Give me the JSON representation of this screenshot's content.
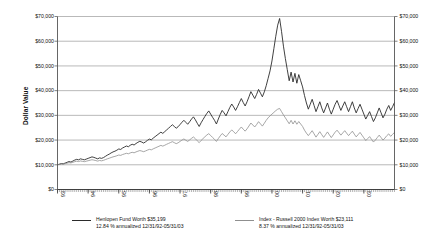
{
  "chart_data": {
    "type": "line",
    "title": "",
    "xlabel": "",
    "ylabel": "Dollar Value",
    "ylim": [
      0,
      70000
    ],
    "y_ticks": [
      "$0",
      "$10,000",
      "$20,000",
      "$30,000",
      "$40,000",
      "$50,000",
      "$60,000",
      "$70,000"
    ],
    "y_tick_values": [
      0,
      10000,
      20000,
      30000,
      40000,
      50000,
      60000,
      70000
    ],
    "right_axis_ticks": [
      "$0",
      "$10,000",
      "$20,000",
      "$30,000",
      "$40,000",
      "$50,000",
      "$60,000",
      "$70,000"
    ],
    "grid": true,
    "legend_position": "bottom",
    "x_tick_labels": [
      "93",
      "94",
      "95",
      "96",
      "97",
      "98",
      "99",
      "00",
      "01",
      "02",
      "03"
    ],
    "x_range_start": "12/31/92",
    "x_range_end": "05/31/03",
    "series": [
      {
        "name": "Henlopen Fund",
        "color": "#2b2b2b",
        "final_value": 35199,
        "values": [
          10000,
          10250,
          10500,
          10400,
          10700,
          11000,
          11300,
          11100,
          11500,
          11900,
          12200,
          12000,
          12400,
          12200,
          12000,
          12300,
          12600,
          12900,
          13200,
          13000,
          12700,
          12400,
          12800,
          12600,
          12900,
          13400,
          13900,
          14300,
          14800,
          15200,
          15500,
          15900,
          16400,
          16200,
          16800,
          17200,
          17600,
          17300,
          17900,
          18300,
          18000,
          18600,
          19100,
          19500,
          19200,
          18800,
          19300,
          19900,
          20400,
          20100,
          20800,
          21400,
          22000,
          22600,
          23200,
          22700,
          23400,
          24100,
          24800,
          25500,
          26200,
          25500,
          24800,
          25400,
          26300,
          27200,
          28000,
          27200,
          26400,
          27400,
          28500,
          29400,
          28200,
          26800,
          25500,
          27000,
          28300,
          29600,
          30800,
          31800,
          30500,
          29200,
          28000,
          26500,
          28500,
          30400,
          32000,
          31000,
          29800,
          31500,
          33200,
          34600,
          33400,
          32000,
          33500,
          35200,
          36800,
          35200,
          33800,
          35500,
          37500,
          39600,
          38200,
          36800,
          38500,
          40500,
          39000,
          37500,
          39500,
          42000,
          45000,
          48000,
          52000,
          57000,
          62000,
          66500,
          69200,
          64000,
          58000,
          53000,
          48500,
          44000,
          47500,
          43500,
          47000,
          43000,
          46500,
          44000,
          41500,
          38000,
          35000,
          32500,
          34500,
          36500,
          34000,
          31500,
          33500,
          35500,
          33000,
          31000,
          33000,
          35000,
          32500,
          30500,
          32500,
          34500,
          36000,
          34000,
          32000,
          33800,
          35500,
          33500,
          31500,
          33500,
          35500,
          33000,
          31000,
          32800,
          34500,
          32500,
          30500,
          28500,
          30000,
          31500,
          29500,
          27500,
          29000,
          31000,
          33000,
          31000,
          29000,
          30500,
          32500,
          34000,
          32000,
          33500,
          35199
        ]
      },
      {
        "name": "Index - Russell 2000 Index",
        "color": "#8f8f8f",
        "final_value": 23111,
        "values": [
          10000,
          10150,
          10300,
          10250,
          10450,
          10650,
          10850,
          10750,
          11000,
          11250,
          11450,
          11300,
          11550,
          11400,
          11250,
          11450,
          11650,
          11850,
          12050,
          11900,
          11700,
          11500,
          11750,
          11600,
          11800,
          12100,
          12400,
          12650,
          12950,
          13200,
          13400,
          13650,
          13950,
          13800,
          14150,
          14400,
          14650,
          14450,
          14800,
          15050,
          14850,
          15200,
          15500,
          15750,
          15550,
          15300,
          15600,
          15950,
          16250,
          16050,
          16450,
          16800,
          17150,
          17500,
          17850,
          17550,
          17900,
          18300,
          18650,
          19000,
          19350,
          18950,
          18550,
          18900,
          19450,
          20000,
          20450,
          19950,
          19450,
          20050,
          20700,
          21250,
          20550,
          19700,
          18950,
          19850,
          20600,
          21350,
          22050,
          22600,
          21850,
          21050,
          20300,
          19450,
          20600,
          21700,
          22650,
          22000,
          21300,
          22300,
          23300,
          24100,
          23400,
          22550,
          23450,
          24400,
          25300,
          24400,
          23600,
          24550,
          25700,
          26900,
          26100,
          25300,
          26300,
          27450,
          26550,
          25650,
          26800,
          28000,
          29000,
          29800,
          30500,
          31200,
          31900,
          32500,
          32800,
          31500,
          30200,
          29000,
          27800,
          26600,
          28000,
          26500,
          27800,
          26400,
          27500,
          26500,
          25500,
          24000,
          22800,
          21800,
          22800,
          23800,
          22500,
          21200,
          22300,
          23400,
          22200,
          21100,
          22200,
          23300,
          22100,
          21000,
          22100,
          23200,
          24000,
          23000,
          22000,
          22900,
          23800,
          22800,
          21800,
          22700,
          23600,
          22400,
          21300,
          22200,
          23100,
          22000,
          20900,
          19800,
          20600,
          21400,
          20300,
          19200,
          20000,
          21000,
          22000,
          21000,
          20000,
          20800,
          21800,
          22500,
          21500,
          22300,
          23111
        ]
      }
    ]
  },
  "legend": {
    "entries": [
      {
        "color": "#2b2b2b",
        "line1": "Henlopen Fund Worth $35,199",
        "line2": "12.84 % annualized 12/31/92-05/31/03"
      },
      {
        "color": "#8f8f8f",
        "line1": "Index - Russell 2000 Index Worth $23,111",
        "line2": "8.37 % annualized 12/31/92-05/31/03"
      }
    ]
  }
}
